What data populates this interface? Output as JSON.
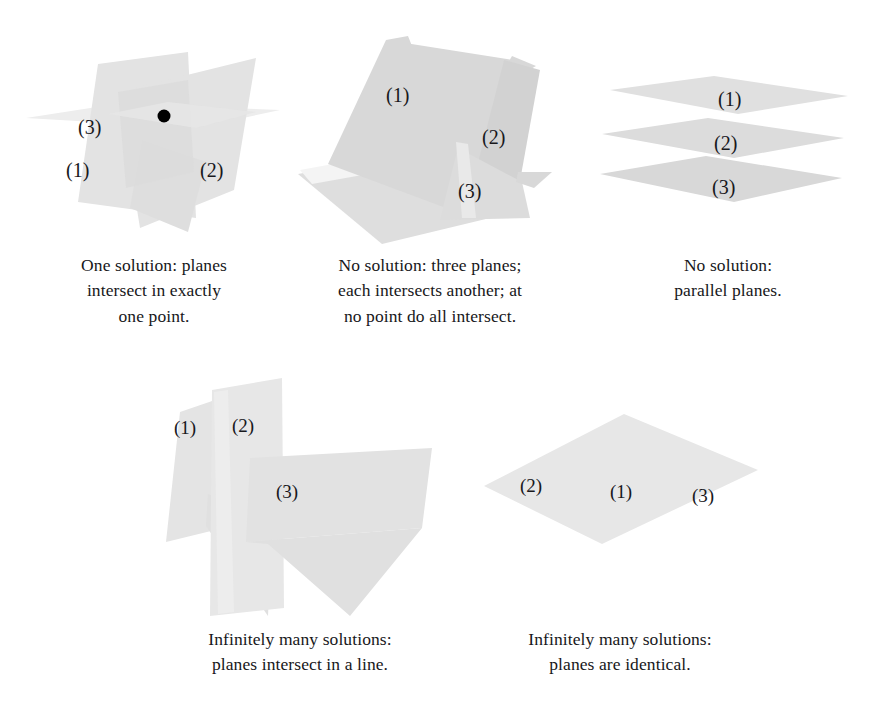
{
  "page": {
    "background_color": "#ffffff",
    "plane_fill_light": "#ebebeb",
    "plane_fill_mid": "#e0e0e0",
    "plane_fill_dark": "#d4d4d4",
    "label_color": "#18181c",
    "point_color": "#000000"
  },
  "figures": [
    {
      "id": "one-solution",
      "plane_labels": [
        "(1)",
        "(2)",
        "(3)"
      ],
      "has_intersection_point": true,
      "caption_lines": [
        "One solution: planes",
        "intersect in exactly",
        "one point."
      ]
    },
    {
      "id": "no-solution-triangular",
      "plane_labels": [
        "(1)",
        "(2)",
        "(3)"
      ],
      "has_intersection_point": false,
      "caption_lines": [
        "No solution: three planes;",
        "each intersects another; at",
        "no point do all intersect."
      ]
    },
    {
      "id": "parallel-planes",
      "plane_labels": [
        "(1)",
        "(2)",
        "(3)"
      ],
      "has_intersection_point": false,
      "caption_lines": [
        "No solution:",
        "parallel planes."
      ]
    },
    {
      "id": "intersect-in-line",
      "plane_labels": [
        "(1)",
        "(2)",
        "(3)"
      ],
      "has_intersection_point": false,
      "caption_lines": [
        "Infinitely many solutions:",
        "planes intersect in a line."
      ]
    },
    {
      "id": "identical-planes",
      "plane_labels": [
        "(1)",
        "(2)",
        "(3)"
      ],
      "has_intersection_point": false,
      "caption_lines": [
        "Infinitely many solutions:",
        "planes are identical."
      ]
    }
  ]
}
